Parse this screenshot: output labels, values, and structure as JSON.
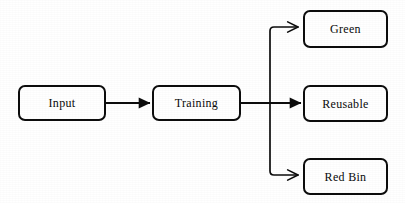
{
  "diagram": {
    "type": "flowchart",
    "orientation": "left-to-right",
    "background_color": "#ffffff",
    "stroke_color": "#0d0d0d",
    "text_color": "#0a0a0a",
    "nodes": [
      {
        "id": "input",
        "label": "Input",
        "shape": "rounded-rectangle"
      },
      {
        "id": "training",
        "label": "Training",
        "shape": "rounded-rectangle"
      },
      {
        "id": "green",
        "label": "Green",
        "shape": "rounded-rectangle"
      },
      {
        "id": "reusable",
        "label": "Reusable",
        "shape": "rounded-rectangle"
      },
      {
        "id": "redbin",
        "label": "Red Bin",
        "shape": "rounded-rectangle"
      }
    ],
    "edges": [
      {
        "id": "input-to-training",
        "from": "Input",
        "to": "Training",
        "arrowhead": "filled"
      },
      {
        "id": "training-to-reusable",
        "from": "Training",
        "to": "Reusable",
        "arrowhead": "filled"
      },
      {
        "id": "training-to-green",
        "from": "Training",
        "to": "Green",
        "arrowhead": "open"
      },
      {
        "id": "training-to-redbin",
        "from": "Training",
        "to": "Red Bin",
        "arrowhead": "open"
      }
    ]
  }
}
